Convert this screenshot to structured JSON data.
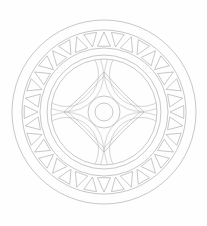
{
  "artwork": {
    "title": "Circular Mandala Line Drawing",
    "type": "geometric-mandala",
    "background_color": "#fefefe",
    "stroke_color": "#b9b9bd",
    "stroke_width": 0.8,
    "canvas": {
      "width": 207,
      "height": 226
    }
  },
  "geometry": {
    "center": {
      "x": 104,
      "y": 112
    },
    "rings": [
      {
        "name": "outer-rim-circle",
        "radius": 92
      },
      {
        "name": "triangle-band-outer-circle",
        "radius": 82
      },
      {
        "name": "triangle-band-inner-circle",
        "radius": 64
      },
      {
        "name": "inner-disc-circle",
        "radius": 57
      },
      {
        "name": "inner-disc-circle-secondary",
        "radius": 53
      },
      {
        "name": "center-outer-circle",
        "radius": 16
      },
      {
        "name": "center-inner-circle",
        "radius": 9
      }
    ],
    "triangle_band": {
      "count": 36,
      "alternation": "up-down",
      "triangle_height": 14,
      "triangle_base": 13,
      "orientation_note": "apex alternately points toward center and toward rim"
    },
    "petal_arcs": {
      "count": 4,
      "arc_centers_radius": 53,
      "arc_radius_outer": 37,
      "arc_radius_inner": 32,
      "angles_deg": [
        45,
        135,
        225,
        315
      ],
      "note": "four overlapping circles carve a four-pointed astroid star at the core"
    },
    "star": {
      "points": 4,
      "outer_radius": 40,
      "concave_radius": 26,
      "inner_offset": 4
    }
  },
  "labels": {
    "alt_text": "Decorative circular mandala with a ring of 36 alternating triangles and a four-petal star core"
  }
}
